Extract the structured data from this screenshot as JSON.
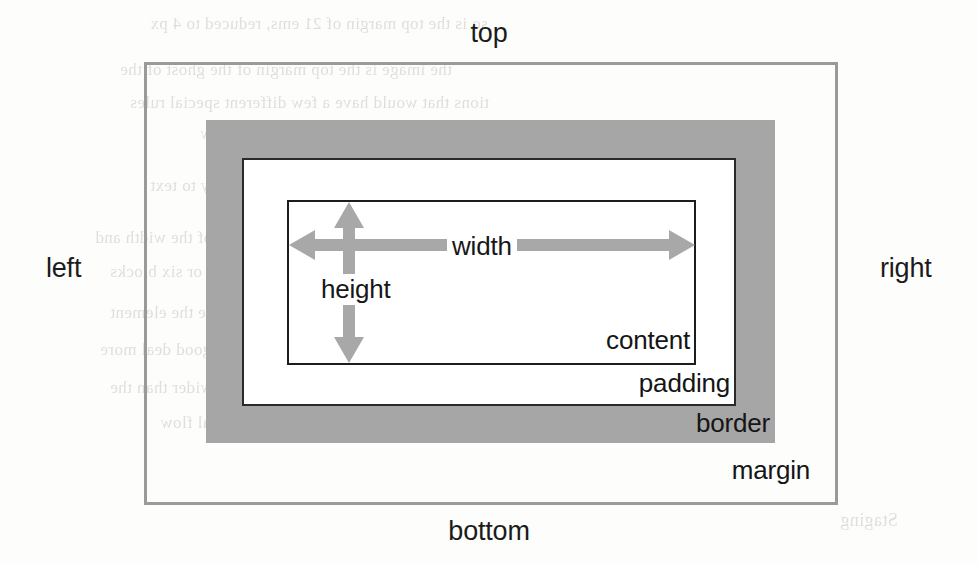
{
  "diagram": {
    "type": "nested-box-model",
    "canvas": {
      "width": 978,
      "height": 564,
      "background": "#fdfdfc"
    },
    "outer_labels": {
      "top": "top",
      "right": "right",
      "bottom": "bottom",
      "left": "left"
    },
    "dimension_labels": {
      "width": "width",
      "height": "height"
    },
    "part_labels": {
      "content": "content",
      "padding": "padding",
      "border": "border",
      "margin": "margin"
    },
    "boxes": [
      {
        "name": "margin",
        "label": "margin",
        "fill": "transparent",
        "stroke": "#9a9a9a",
        "stroke_width": 3,
        "x": 144,
        "y": 62,
        "width": 694,
        "height": 443
      },
      {
        "name": "border",
        "label": "border",
        "fill": "#a6a6a6",
        "stroke": "none",
        "stroke_width": 0,
        "x": 206,
        "y": 120,
        "width": 569,
        "height": 323
      },
      {
        "name": "padding",
        "label": "padding",
        "fill": "#ffffff",
        "stroke": "#2a2a2a",
        "stroke_width": 2,
        "x": 242,
        "y": 158,
        "width": 494,
        "height": 248
      },
      {
        "name": "content",
        "label": "content",
        "fill": "#ffffff",
        "stroke": "#1d1d1d",
        "stroke_width": 2,
        "x": 287,
        "y": 200,
        "width": 409,
        "height": 165
      }
    ],
    "arrows": [
      {
        "name": "width-arrow",
        "orientation": "horizontal",
        "style": "double-headed",
        "color": "#a8a8a8",
        "label": "width",
        "from_x": 289,
        "to_x": 695,
        "y": 245
      },
      {
        "name": "height-arrow",
        "orientation": "vertical",
        "style": "double-headed",
        "color": "#a8a8a8",
        "label": "height",
        "x": 349,
        "from_y": 202,
        "to_y": 363
      }
    ],
    "colors": {
      "page_background": "#fdfdfc",
      "border_fill": "#a6a6a6",
      "margin_stroke": "#9a9a9a",
      "box_outline": "#1d1d1d",
      "arrow": "#a8a8a8",
      "text": "#151515",
      "bleed_text": "#b9b5ae"
    }
  },
  "scan_bleed": {
    "note": "faint mirrored text bleeding through from the reverse side of the scanned book page",
    "lines": [
      {
        "text": "so is the top margin of 21 ems, reduced to 4 px",
        "x": 150,
        "y": 14,
        "size": 17
      },
      {
        "text": "the image is the top margin of the ghost of the",
        "x": 120,
        "y": 60,
        "size": 17
      },
      {
        "text": "tions that would have a few different special rules",
        "x": 130,
        "y": 93,
        "size": 17
      },
      {
        "text": "cases the two dimensions of the new",
        "x": 200,
        "y": 125,
        "size": 16
      },
      {
        "text": "specified. There are no rules that apply to text",
        "x": 150,
        "y": 176,
        "size": 17
      },
      {
        "text": "result is a collapsed margin. The value of the width and",
        "x": 95,
        "y": 228,
        "size": 17
      },
      {
        "text": "which are used. Here we have four or six blocks",
        "x": 110,
        "y": 262,
        "size": 17
      },
      {
        "text": "top of the box and then to compute the element",
        "x": 110,
        "y": 303,
        "size": 17
      },
      {
        "text": "This makes the overall line box a good deal more",
        "x": 100,
        "y": 340,
        "size": 17
      },
      {
        "text": "you do when the content area is wider than the",
        "x": 110,
        "y": 378,
        "size": 17
      },
      {
        "text": "unusual vertical height in this normal flow",
        "x": 160,
        "y": 413,
        "size": 17
      },
      {
        "text": "Staging",
        "x": 840,
        "y": 510,
        "size": 18
      }
    ]
  }
}
